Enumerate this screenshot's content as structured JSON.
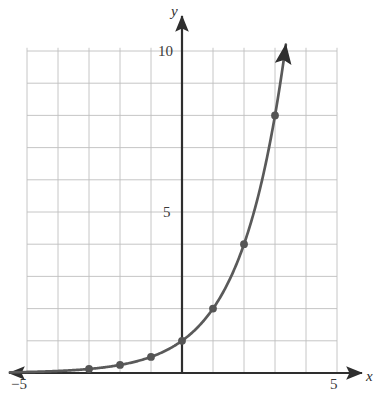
{
  "figure": {
    "kind": "cartesian-graph",
    "background": "#ffffff",
    "grid_color": "#bfbfbf",
    "axis_color": "#3a3a3a",
    "curve_color": "#5a5a5a",
    "point_color": "#555555"
  },
  "axes": {
    "x_name": "x",
    "y_name": "y",
    "x_tick_labels": [
      "−5",
      "5"
    ],
    "y_tick_labels": [
      "5",
      "10"
    ]
  },
  "chart_data": {
    "type": "line",
    "title": "",
    "subtitle": "",
    "xlabel": "x",
    "ylabel": "y",
    "function": "y = 2^x",
    "grid": true,
    "legend": "none",
    "xlim": [
      -5,
      5
    ],
    "ylim": [
      0,
      10.1
    ],
    "xticks": [
      -5,
      5
    ],
    "yticks": [
      5,
      10
    ],
    "grid_step_x": 1,
    "grid_step_y": 1,
    "x": [
      -5,
      -4.5,
      -4,
      -3.5,
      -3,
      -2.5,
      -2,
      -1.5,
      -1,
      -0.5,
      0,
      0.5,
      1,
      1.5,
      2,
      2.5,
      3,
      3.35
    ],
    "y": [
      0.03125,
      0.04419,
      0.0625,
      0.08839,
      0.125,
      0.17678,
      0.25,
      0.35355,
      0.5,
      0.70711,
      1,
      1.41421,
      2,
      2.82843,
      4,
      5.65685,
      8,
      10.19
    ],
    "marked_points": [
      {
        "x": -3,
        "y": 0.125
      },
      {
        "x": -2,
        "y": 0.25
      },
      {
        "x": -1,
        "y": 0.5
      },
      {
        "x": 0,
        "y": 1
      },
      {
        "x": 1,
        "y": 2
      },
      {
        "x": 2,
        "y": 4
      },
      {
        "x": 3,
        "y": 8
      }
    ],
    "arrows": [
      "x-axis-left",
      "x-axis-right",
      "y-axis-up",
      "curve-upper-right"
    ]
  }
}
